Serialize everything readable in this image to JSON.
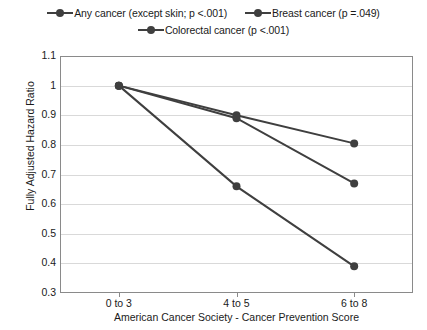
{
  "chart_data": {
    "type": "line",
    "title": "",
    "xlabel": "American Cancer Society - Cancer Prevention Score",
    "ylabel": "Fully Adjusted Hazard Ratio",
    "categories": [
      "0 to 3",
      "4 to 5",
      "6 to 8"
    ],
    "ylim": [
      0.3,
      1.1
    ],
    "yticks": [
      "0.3",
      "0.4",
      "0.5",
      "0.6",
      "0.7",
      "0.8",
      "0.9",
      "1",
      "1.1"
    ],
    "ytick_values": [
      0.3,
      0.4,
      0.5,
      0.6,
      0.7,
      0.8,
      0.9,
      1.0,
      1.1
    ],
    "grid": true,
    "legend_position": "top",
    "series": [
      {
        "name": "Any cancer (except skin; p <.001)",
        "values": [
          1.0,
          0.9,
          0.805
        ],
        "color": "#3f3f3f",
        "marker": "circle"
      },
      {
        "name": "Breast cancer (p =.049)",
        "values": [
          1.0,
          0.89,
          0.67
        ],
        "color": "#3f3f3f",
        "marker": "circle"
      },
      {
        "name": "Colorectal cancer (p <.001)",
        "values": [
          1.0,
          0.66,
          0.39
        ],
        "color": "#3f3f3f",
        "marker": "circle"
      }
    ]
  },
  "legend": {
    "rows": [
      [
        "Any cancer (except skin; p <.001)",
        "Breast cancer (p =.049)"
      ],
      [
        "Colorectal cancer (p <.001)"
      ]
    ]
  },
  "axes": {
    "y_title": "Fully Adjusted Hazard Ratio",
    "x_title": "American Cancer Society - Cancer Prevention Score",
    "y_labels": [
      "1.1",
      "1",
      "0.9",
      "0.8",
      "0.7",
      "0.6",
      "0.5",
      "0.4",
      "0.3"
    ],
    "x_labels": [
      "0 to 3",
      "4 to 5",
      "6 to 8"
    ]
  },
  "colors": {
    "series": "#3f3f3f",
    "gridline": "#d9d9d9",
    "border": "#8a8a8a",
    "text": "#1a1a1a",
    "background": "#ffffff"
  }
}
